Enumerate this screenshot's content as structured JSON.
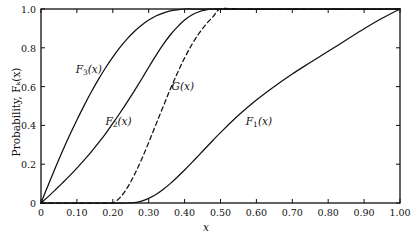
{
  "figure": {
    "background": "#ffffff",
    "line_color": "#101010"
  },
  "axes": {
    "x": {
      "label": "x",
      "ticks": [
        "0",
        "0.10",
        "0.20",
        "0.30",
        "0.40",
        "0.50",
        "0.60",
        "0.70",
        "0.80",
        "0.90",
        "1.00"
      ],
      "tick_values": [
        0,
        0.1,
        0.2,
        0.3,
        0.4,
        0.5,
        0.6,
        0.7,
        0.8,
        0.9,
        1.0
      ],
      "range": [
        0,
        1.0
      ]
    },
    "y": {
      "label": "Probability, Fₖ(x)",
      "ticks": [
        "0",
        "0.2",
        "0.4",
        "0.6",
        "0.8",
        "1.0"
      ],
      "tick_values": [
        0,
        0.2,
        0.4,
        0.6,
        0.8,
        1.0
      ],
      "range": [
        0,
        1.0
      ]
    }
  },
  "curve_labels": [
    {
      "id": "F3",
      "text_prefix": "F",
      "sub": "3",
      "suffix": "(x)",
      "x": 0.133,
      "y": 0.685
    },
    {
      "id": "F2",
      "text_prefix": "F",
      "sub": "2",
      "suffix": "(x)",
      "x": 0.216,
      "y": 0.415
    },
    {
      "id": "G",
      "text_prefix": "G",
      "sub": "",
      "suffix": "(x)",
      "x": 0.395,
      "y": 0.605
    },
    {
      "id": "F1",
      "text_prefix": "F",
      "sub": "1",
      "suffix": "(x)",
      "x": 0.607,
      "y": 0.415
    }
  ],
  "chart_data": {
    "type": "line",
    "title": "",
    "xlabel": "x",
    "ylabel": "Probability, F_k(x)",
    "xlim": [
      0,
      1.0
    ],
    "ylim": [
      0,
      1.0
    ],
    "grid": false,
    "legend": "inline-curve-labels",
    "x": [
      0.0,
      0.02,
      0.04,
      0.06,
      0.08,
      0.1,
      0.12,
      0.14,
      0.16,
      0.18,
      0.2,
      0.22,
      0.24,
      0.26,
      0.28,
      0.3,
      0.32,
      0.34,
      0.36,
      0.38,
      0.4,
      0.42,
      0.44,
      0.46,
      0.48,
      0.5,
      0.55,
      0.6,
      0.65,
      0.7,
      0.75,
      0.8,
      0.85,
      0.9,
      0.95,
      1.0
    ],
    "series": [
      {
        "name": "F_1(x)",
        "style": "solid",
        "values": [
          0.0,
          0.0,
          0.0,
          0.0,
          0.0,
          0.0,
          0.0,
          0.0,
          0.0,
          0.0,
          0.0,
          0.0,
          0.0,
          0.002,
          0.01,
          0.024,
          0.044,
          0.07,
          0.1,
          0.134,
          0.17,
          0.208,
          0.247,
          0.286,
          0.325,
          0.363,
          0.452,
          0.531,
          0.601,
          0.665,
          0.724,
          0.782,
          0.84,
          0.898,
          0.952,
          1.0
        ]
      },
      {
        "name": "F_2(x)",
        "style": "solid",
        "values": [
          0.0,
          0.033,
          0.068,
          0.104,
          0.141,
          0.18,
          0.221,
          0.264,
          0.31,
          0.358,
          0.41,
          0.464,
          0.52,
          0.578,
          0.638,
          0.7,
          0.76,
          0.816,
          0.866,
          0.908,
          0.943,
          0.969,
          0.986,
          0.996,
          1.0,
          1.0,
          1.0,
          1.0,
          1.0,
          1.0,
          1.0,
          1.0,
          1.0,
          1.0,
          1.0,
          1.0
        ]
      },
      {
        "name": "F_3(x)",
        "style": "solid",
        "values": [
          0.0,
          0.092,
          0.182,
          0.268,
          0.35,
          0.428,
          0.502,
          0.572,
          0.637,
          0.697,
          0.752,
          0.802,
          0.846,
          0.884,
          0.916,
          0.943,
          0.964,
          0.979,
          0.99,
          0.996,
          1.0,
          1.0,
          1.0,
          1.0,
          1.0,
          1.0,
          1.0,
          1.0,
          1.0,
          1.0,
          1.0,
          1.0,
          1.0,
          1.0,
          1.0,
          1.0
        ]
      },
      {
        "name": "G(x)",
        "style": "dashed",
        "values": [
          0.0,
          0.0,
          0.0,
          0.0,
          0.0,
          0.0,
          0.0,
          0.0,
          0.0,
          0.0,
          0.0,
          0.028,
          0.078,
          0.145,
          0.224,
          0.312,
          0.404,
          0.496,
          0.586,
          0.67,
          0.748,
          0.816,
          0.874,
          0.922,
          0.962,
          1.0,
          1.0,
          1.0,
          1.0,
          1.0,
          1.0,
          1.0,
          1.0,
          1.0,
          1.0,
          1.0
        ]
      }
    ]
  }
}
